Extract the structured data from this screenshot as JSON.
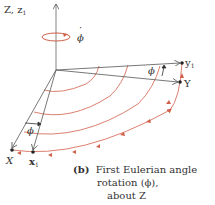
{
  "diagram": {
    "labels": {
      "z_axis": "Z, z",
      "z_axis_sub": "1",
      "phi_dot": "ϕ",
      "phi_dot_mark": "·",
      "y1": "y",
      "y1_sub": "1",
      "Y": "Y",
      "X": "X",
      "x1": "x",
      "x1_sub": "1",
      "phi_bottom": "ϕ",
      "phi_right": "ϕ"
    },
    "caption": {
      "tag": "(b)",
      "line1": "First Eulerian angle",
      "line2": "rotation (ϕ),",
      "line3": "about Z"
    },
    "colors": {
      "axis": "#555555",
      "arc": "#d0604a",
      "text": "#333333"
    }
  }
}
